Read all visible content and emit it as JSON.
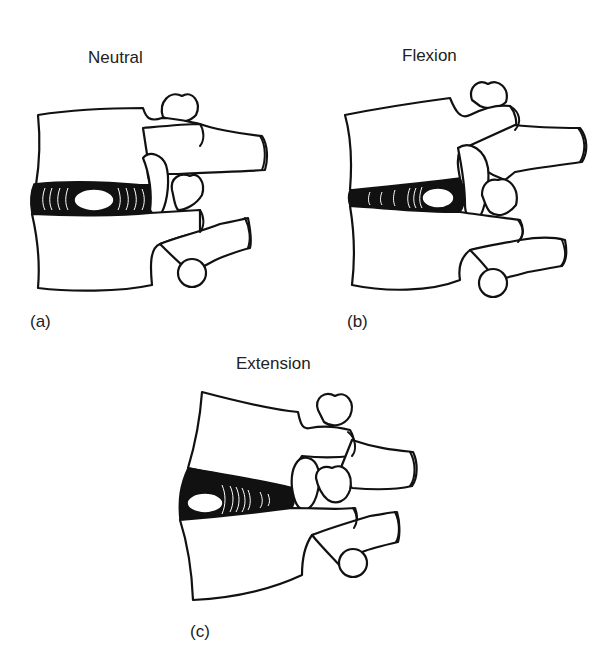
{
  "figure": {
    "panels": [
      {
        "id": "a",
        "title": "Neutral",
        "label": "(a)"
      },
      {
        "id": "b",
        "title": "Flexion",
        "label": "(b)"
      },
      {
        "id": "c",
        "title": "Extension",
        "label": "(c)"
      }
    ]
  },
  "colors": {
    "line": "#111111",
    "background": "#ffffff"
  }
}
